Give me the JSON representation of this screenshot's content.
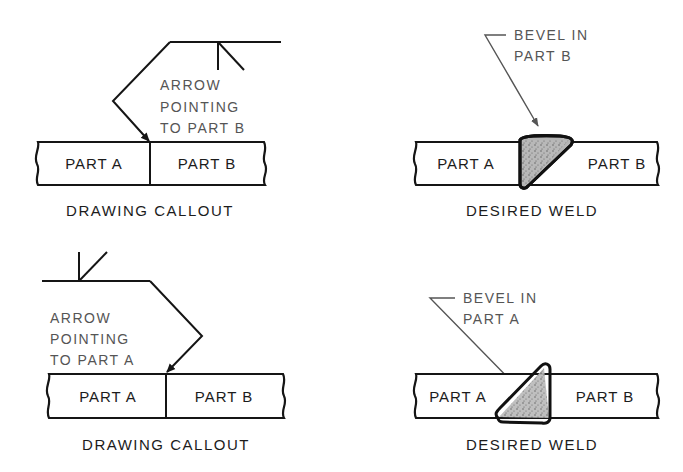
{
  "panels": {
    "top_left": {
      "title": "DRAWING CALLOUT",
      "note": [
        "ARROW",
        "POINTING",
        "TO PART B"
      ],
      "part_left": "PART A",
      "part_right": "PART B"
    },
    "top_right": {
      "title": "DESIRED WELD",
      "note": [
        "BEVEL IN",
        "PART B"
      ],
      "part_left": "PART A",
      "part_right": "PART B"
    },
    "bottom_left": {
      "title": "DRAWING CALLOUT",
      "note": [
        "ARROW",
        "POINTING",
        "TO PART A"
      ],
      "part_left": "PART A",
      "part_right": "PART B"
    },
    "bottom_right": {
      "title": "DESIRED WELD",
      "note": [
        "BEVEL IN",
        "PART A"
      ],
      "part_left": "PART A",
      "part_right": "PART B"
    }
  },
  "colors": {
    "line": "#151515",
    "note_text": "#555555",
    "weld_fill": "#b5b5b5"
  }
}
